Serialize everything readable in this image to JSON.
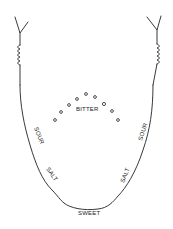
{
  "diagram": {
    "labels": {
      "bitter": "BITTER",
      "sour_left": "SOUR",
      "sour_right": "SOUR",
      "salt_left": "SALT",
      "salt_right": "SALT",
      "sweet": "SWEET"
    },
    "regions": [
      {
        "name": "bitter",
        "location": "back center"
      },
      {
        "name": "sour",
        "location": "left and right sides (rear)"
      },
      {
        "name": "salt",
        "location": "left and right sides (front)"
      },
      {
        "name": "sweet",
        "location": "tip"
      }
    ],
    "colors": {
      "line": "#222222",
      "background": "#ffffff"
    }
  }
}
